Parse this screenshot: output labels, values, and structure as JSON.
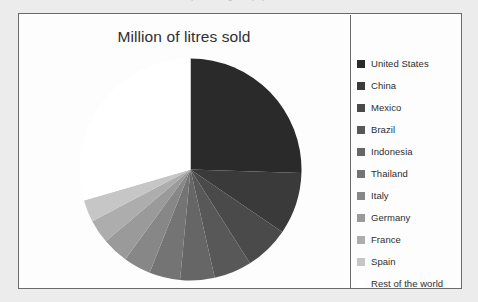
{
  "top_artifacts": [
    {
      "text": "Marc... from 2... percentage ... population"
    }
  ],
  "chart": {
    "title": "Million of litres sold",
    "border_color": "#6b6b6b",
    "background_color": "#fdfdfd"
  },
  "chart_data": {
    "type": "pie",
    "title": "Million of litres sold",
    "xlabel": "",
    "ylabel": "",
    "legend_position": "right",
    "grid": false,
    "start_angle_deg": 0,
    "direction": "clockwise",
    "categories": [
      "United States",
      "China",
      "Mexico",
      "Brazil",
      "Indonesia",
      "Thailand",
      "Italy",
      "Germany",
      "France",
      "Spain",
      "Rest of the world"
    ],
    "values": [
      25.5,
      9.0,
      6.5,
      5.5,
      5.0,
      4.5,
      4.0,
      3.8,
      3.5,
      3.2,
      29.5
    ],
    "unit": "percent",
    "colors": [
      "#2a2a2a",
      "#3a3a3a",
      "#4a4a4a",
      "#585858",
      "#666666",
      "#747474",
      "#878787",
      "#9a9a9a",
      "#adadad",
      "#c6c6c6",
      "#ffffff"
    ],
    "slices": [
      {
        "label": "United States",
        "value": 25.5,
        "color": "#2a2a2a"
      },
      {
        "label": "China",
        "value": 9.0,
        "color": "#3a3a3a"
      },
      {
        "label": "Mexico",
        "value": 6.5,
        "color": "#4a4a4a"
      },
      {
        "label": "Brazil",
        "value": 5.5,
        "color": "#585858"
      },
      {
        "label": "Indonesia",
        "value": 5.0,
        "color": "#666666"
      },
      {
        "label": "Thailand",
        "value": 4.5,
        "color": "#747474"
      },
      {
        "label": "Italy",
        "value": 4.0,
        "color": "#878787"
      },
      {
        "label": "Germany",
        "value": 3.8,
        "color": "#9a9a9a"
      },
      {
        "label": "France",
        "value": 3.5,
        "color": "#adadad"
      },
      {
        "label": "Spain",
        "value": 3.2,
        "color": "#c6c6c6"
      },
      {
        "label": "Rest of the world",
        "value": 29.5,
        "color": "#ffffff"
      }
    ]
  },
  "legend": {
    "items": [
      {
        "label": "United States",
        "color": "#2a2a2a"
      },
      {
        "label": "China",
        "color": "#3a3a3a"
      },
      {
        "label": "Mexico",
        "color": "#4a4a4a"
      },
      {
        "label": "Brazil",
        "color": "#585858"
      },
      {
        "label": "Indonesia",
        "color": "#666666"
      },
      {
        "label": "Thailand",
        "color": "#747474"
      },
      {
        "label": "Italy",
        "color": "#878787"
      },
      {
        "label": "Germany",
        "color": "#9a9a9a"
      },
      {
        "label": "France",
        "color": "#adadad"
      },
      {
        "label": "Spain",
        "color": "#c6c6c6"
      },
      {
        "label": "Rest of the world",
        "color": "#ffffff"
      }
    ]
  }
}
